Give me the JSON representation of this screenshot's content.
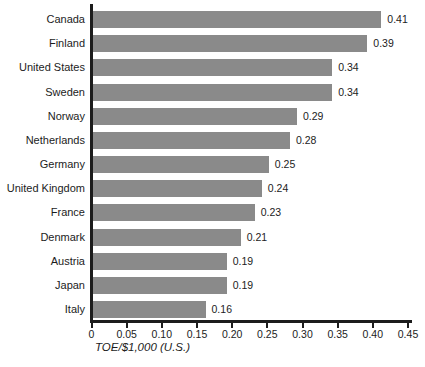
{
  "chart_data": {
    "type": "bar",
    "orientation": "horizontal",
    "title": "",
    "xlabel": "TOE/$1,000 (U.S.)",
    "ylabel": "",
    "categories": [
      "Canada",
      "Finland",
      "United States",
      "Sweden",
      "Norway",
      "Netherlands",
      "Germany",
      "United Kingdom",
      "France",
      "Denmark",
      "Austria",
      "Japan",
      "Italy"
    ],
    "values": [
      0.41,
      0.39,
      0.34,
      0.34,
      0.29,
      0.28,
      0.25,
      0.24,
      0.23,
      0.21,
      0.19,
      0.19,
      0.16
    ],
    "value_labels": [
      "0.41",
      "0.39",
      "0.34",
      "0.34",
      "0.29",
      "0.28",
      "0.25",
      "0.24",
      "0.23",
      "0.21",
      "0.19",
      "0.19",
      "0.16"
    ],
    "xlim": [
      0,
      0.45
    ],
    "x_tick_values": [
      0,
      0.05,
      0.1,
      0.15,
      0.2,
      0.25,
      0.3,
      0.35,
      0.4,
      0.45
    ],
    "x_tick_labels": [
      "0",
      "0.05",
      "0.10",
      "0.15",
      "0.20",
      "0.25",
      "0.30",
      "0.35",
      "0.40",
      "0.45"
    ],
    "grid": false,
    "legend": false,
    "bar_color": "#8a8a8a",
    "axis_color": "#1c1c1c"
  }
}
